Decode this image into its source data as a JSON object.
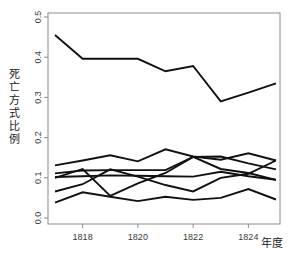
{
  "chart_data": {
    "type": "line",
    "title": "",
    "xlabel": "年度",
    "ylabel": "死亡方式比例",
    "x": [
      1817,
      1818,
      1819,
      1820,
      1821,
      1822,
      1823,
      1824,
      1825
    ],
    "xlim": [
      1817,
      1825
    ],
    "ylim": [
      0.0,
      0.5
    ],
    "xticks": [
      1818,
      1820,
      1822,
      1824
    ],
    "xtick_labels": [
      "1818",
      "1820",
      "1822",
      "1824"
    ],
    "yticks": [
      0.0,
      0.1,
      0.2,
      0.3,
      0.4,
      0.5
    ],
    "ytick_labels": [
      "0.0",
      "0.1",
      "0.2",
      "0.3",
      "0.4",
      "0.5"
    ],
    "grid": false,
    "legend": "none",
    "line_color": "#111111",
    "axis_color": "#8c8c8c",
    "series": [
      {
        "name": "series-1",
        "values": [
          0.455,
          0.396,
          0.396,
          0.396,
          0.365,
          0.378,
          0.29,
          0.312,
          0.335
        ]
      },
      {
        "name": "series-2",
        "values": [
          0.131,
          0.143,
          0.156,
          0.141,
          0.171,
          0.153,
          0.145,
          0.161,
          0.143
        ]
      },
      {
        "name": "series-3",
        "values": [
          0.111,
          0.118,
          0.119,
          0.119,
          0.119,
          0.152,
          0.153,
          0.136,
          0.121
        ]
      },
      {
        "name": "series-4",
        "values": [
          0.102,
          0.104,
          0.106,
          0.105,
          0.104,
          0.103,
          0.115,
          0.104,
          0.095
        ]
      },
      {
        "name": "series-5",
        "values": [
          0.066,
          0.084,
          0.121,
          0.103,
          0.082,
          0.066,
          0.1,
          0.11,
          0.143
        ]
      },
      {
        "name": "series-6",
        "values": [
          0.1,
          0.122,
          0.055,
          0.086,
          0.112,
          0.152,
          0.122,
          0.112,
          0.095
        ]
      },
      {
        "name": "series-7",
        "values": [
          0.038,
          0.064,
          0.053,
          0.042,
          0.053,
          0.045,
          0.05,
          0.072,
          0.046
        ]
      }
    ]
  },
  "ylabel_chars": [
    "死",
    "亡",
    "方",
    "式",
    "比",
    "例"
  ],
  "figure": {
    "plot_left_px": 48,
    "plot_right_px": 280,
    "plot_top_px": 13,
    "plot_bottom_px": 224
  }
}
